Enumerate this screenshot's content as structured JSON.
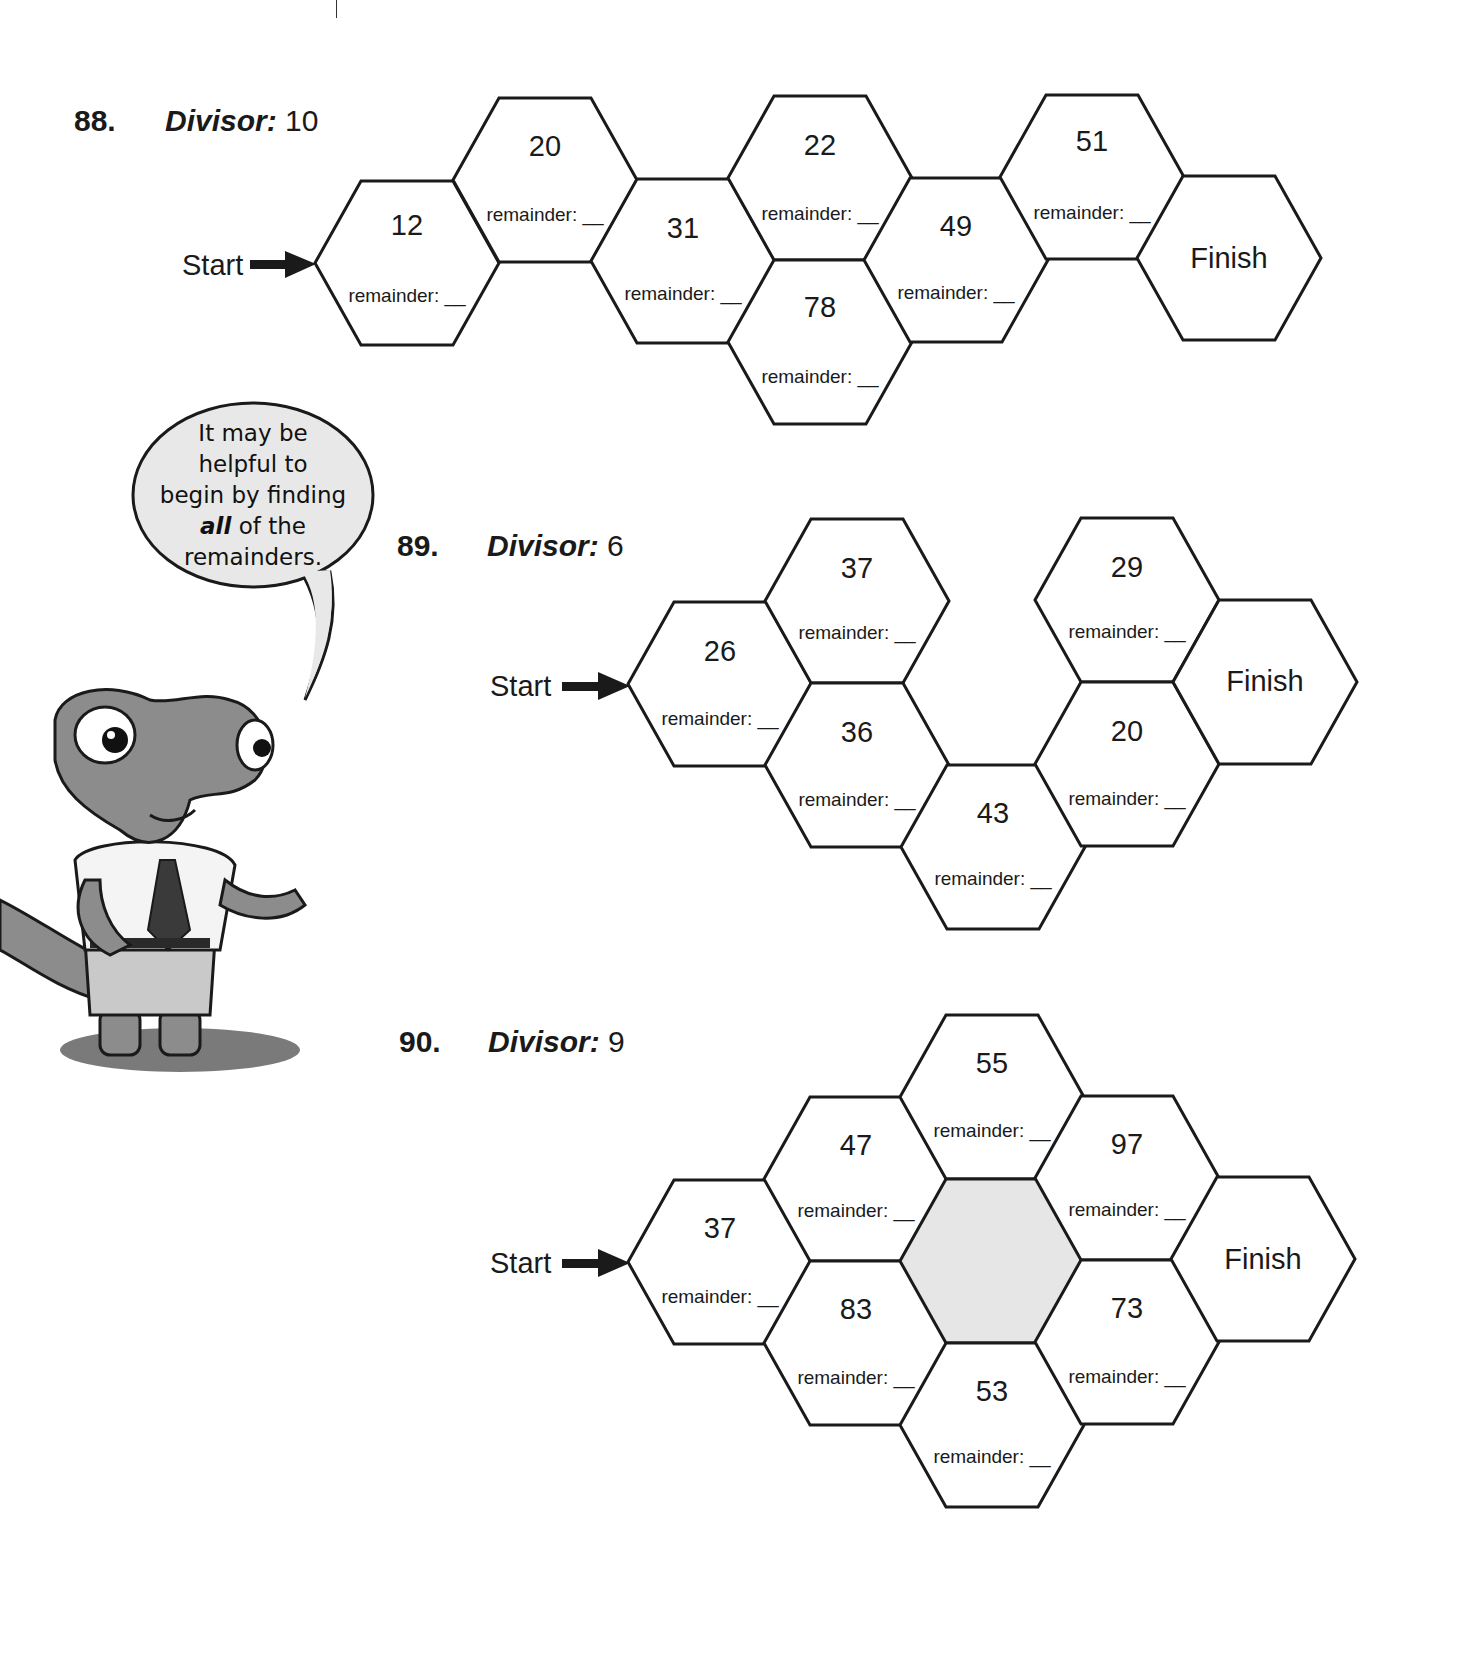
{
  "problems": [
    {
      "number": "88.",
      "divisor_label": "Divisor:",
      "divisor_value": "10",
      "start_label": "Start",
      "finish_label": "Finish",
      "cells": [
        {
          "value": "12",
          "remainder": "remainder: __"
        },
        {
          "value": "20",
          "remainder": "remainder: __"
        },
        {
          "value": "31",
          "remainder": "remainder: __"
        },
        {
          "value": "22",
          "remainder": "remainder: __"
        },
        {
          "value": "78",
          "remainder": "remainder: __"
        },
        {
          "value": "49",
          "remainder": "remainder: __"
        },
        {
          "value": "51",
          "remainder": "remainder: __"
        }
      ]
    },
    {
      "number": "89.",
      "divisor_label": "Divisor:",
      "divisor_value": "6",
      "start_label": "Start",
      "finish_label": "Finish",
      "cells": [
        {
          "value": "26",
          "remainder": "remainder: __"
        },
        {
          "value": "37",
          "remainder": "remainder: __"
        },
        {
          "value": "36",
          "remainder": "remainder: __"
        },
        {
          "value": "43",
          "remainder": "remainder: __"
        },
        {
          "value": "29",
          "remainder": "remainder: __"
        },
        {
          "value": "20",
          "remainder": "remainder: __"
        }
      ]
    },
    {
      "number": "90.",
      "divisor_label": "Divisor:",
      "divisor_value": "9",
      "start_label": "Start",
      "finish_label": "Finish",
      "cells": [
        {
          "value": "37",
          "remainder": "remainder: __"
        },
        {
          "value": "47",
          "remainder": "remainder: __"
        },
        {
          "value": "83",
          "remainder": "remainder: __"
        },
        {
          "value": "55",
          "remainder": "remainder: __"
        },
        {
          "value": "53",
          "remainder": "remainder: __"
        },
        {
          "value": "97",
          "remainder": "remainder: __"
        },
        {
          "value": "73",
          "remainder": "remainder: __"
        }
      ],
      "shaded_center": true
    }
  ],
  "speech_bubble": {
    "line1": "It may be",
    "line2": "helpful to",
    "line3": "begin by finding",
    "line4_emphasis": "all",
    "line4_rest": " of the",
    "line5": "remainders."
  },
  "colors": {
    "ink": "#1a1a1a",
    "shaded_hex": "#e6e6e6",
    "character_gray": "#8c8c8c",
    "bubble_fill": "#e8e8e8"
  }
}
